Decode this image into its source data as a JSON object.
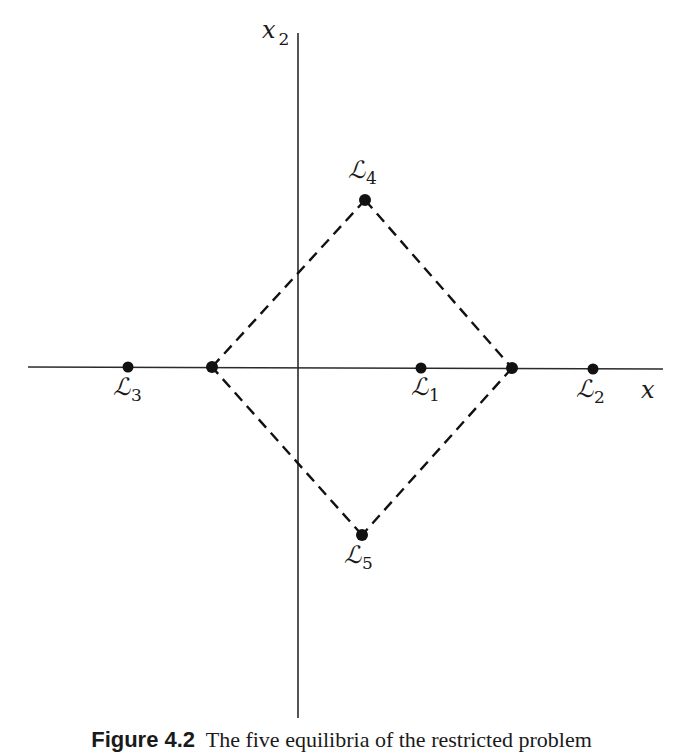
{
  "diagram": {
    "type": "equilibrium-points-plot",
    "axes": {
      "horizontal": {
        "label": "x",
        "from": [
          28,
          367
        ],
        "to": [
          663,
          369
        ]
      },
      "vertical": {
        "label": "x",
        "subscript": "2",
        "from": [
          298,
          33
        ],
        "to": [
          298,
          718
        ]
      }
    },
    "points": [
      {
        "id": "L1",
        "label": "ℒ",
        "subscript": "1",
        "x": 421,
        "y": 368
      },
      {
        "id": "L2",
        "label": "ℒ",
        "subscript": "2",
        "x": 593,
        "y": 369
      },
      {
        "id": "L3",
        "label": "ℒ",
        "subscript": "3",
        "x": 128,
        "y": 367
      },
      {
        "id": "L4",
        "label": "ℒ",
        "subscript": "4",
        "x": 365,
        "y": 200
      },
      {
        "id": "L5",
        "label": "ℒ",
        "subscript": "5",
        "x": 362,
        "y": 535
      }
    ],
    "unlabeled_points": [
      {
        "x": 212,
        "y": 367
      },
      {
        "x": 512,
        "y": 368
      }
    ],
    "dashed_diamond": [
      [
        212,
        367
      ],
      [
        365,
        200
      ],
      [
        512,
        368
      ],
      [
        362,
        535
      ]
    ]
  },
  "caption": {
    "figure_number": "Figure 4.2",
    "text": "The five equilibria of the restricted problem"
  }
}
